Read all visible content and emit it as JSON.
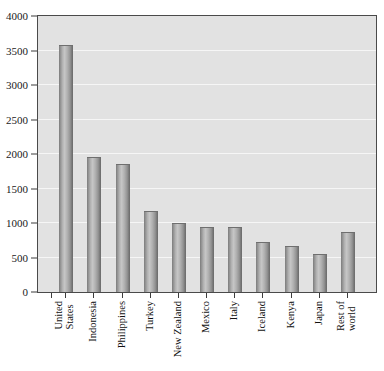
{
  "chart_data": {
    "type": "bar",
    "title": "",
    "subtitle": "",
    "xlabel": "",
    "ylabel": "",
    "categories": [
      "United States",
      "Indonesia",
      "Philippines",
      "Turkey",
      "New Zealand",
      "Mexico",
      "Italy",
      "Iceland",
      "Kenya",
      "Japan",
      "Rest of world"
    ],
    "category_lines": [
      [
        "United",
        "States"
      ],
      [
        "Indonesia",
        ""
      ],
      [
        "Philippines",
        ""
      ],
      [
        "Turkey",
        ""
      ],
      [
        "New Zealand",
        ""
      ],
      [
        "Mexico",
        ""
      ],
      [
        "Italy",
        ""
      ],
      [
        "Iceland",
        ""
      ],
      [
        "Kenya",
        ""
      ],
      [
        "Japan",
        ""
      ],
      [
        "Rest of",
        "world"
      ]
    ],
    "values": [
      3580,
      1950,
      1860,
      1180,
      1000,
      940,
      940,
      730,
      660,
      550,
      870
    ],
    "ylim": [
      0,
      4000
    ],
    "y_ticks": [
      0,
      500,
      1000,
      1500,
      2000,
      2500,
      3000,
      3500,
      4000
    ],
    "y_tick_labels": [
      "0",
      "500",
      "1000",
      "1500",
      "2000",
      "2500",
      "3000",
      "3500",
      "4000"
    ],
    "grid": true,
    "grid_color": "#f6f6f6",
    "legend": false,
    "legend_position": "none",
    "plot_background": "#e2e2e2",
    "bar_color": "#9a9a9a",
    "axis_color": "#3c3c3c",
    "text_color": "#111111",
    "n_bars": 11,
    "bar_count_drawn": 12
  }
}
